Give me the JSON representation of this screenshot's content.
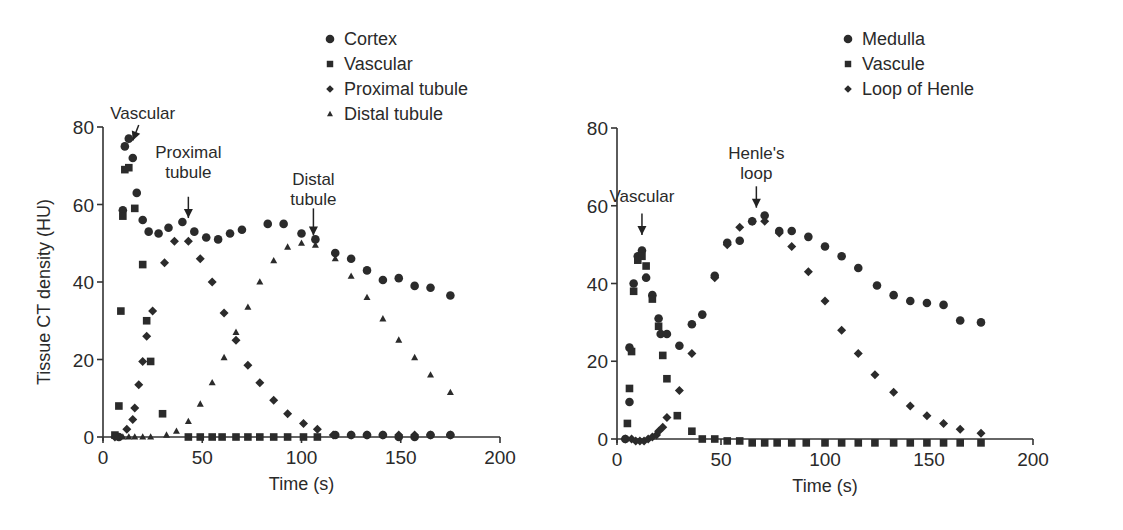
{
  "chart_data": [
    {
      "type": "scatter",
      "title": "",
      "xlabel": "Time (s)",
      "ylabel": "Tissue CT density (HU)",
      "xlim": [
        0,
        200
      ],
      "ylim": [
        0,
        80
      ],
      "xticks": [
        0,
        50,
        100,
        150,
        200
      ],
      "yticks": [
        0,
        20,
        40,
        60,
        80
      ],
      "grid": false,
      "legend_position": "top-right",
      "legend": [
        {
          "label": "Cortex",
          "marker": "circle"
        },
        {
          "label": "Vascular",
          "marker": "square"
        },
        {
          "label": "Proximal tubule",
          "marker": "diamond"
        },
        {
          "label": "Distal tubule",
          "marker": "triangle"
        }
      ],
      "annotations": [
        {
          "text": [
            "Vascular"
          ],
          "text_x": 20,
          "text_y": 82,
          "arrow_from": [
            18,
            80.5
          ],
          "arrow_to": [
            15,
            76.5
          ]
        },
        {
          "text": [
            "Proximal",
            "tubule"
          ],
          "text_x": 43,
          "text_y": 72,
          "arrow_from": [
            43,
            62
          ],
          "arrow_to": [
            43,
            56.5
          ]
        },
        {
          "text": [
            "Distal",
            "tubule"
          ],
          "text_x": 106,
          "text_y": 65,
          "arrow_from": [
            106,
            59
          ],
          "arrow_to": [
            106,
            52
          ]
        }
      ],
      "series": [
        {
          "name": "Cortex",
          "marker": "circle",
          "points": [
            [
              8,
              0
            ],
            [
              10,
              58.5
            ],
            [
              11,
              75
            ],
            [
              13,
              77
            ],
            [
              15,
              72
            ],
            [
              17,
              63
            ],
            [
              20,
              56
            ],
            [
              23,
              53
            ],
            [
              28,
              52.5
            ],
            [
              33,
              54
            ],
            [
              40,
              55.5
            ],
            [
              46,
              53
            ],
            [
              52,
              51.5
            ],
            [
              58,
              51
            ],
            [
              64,
              52.5
            ],
            [
              70,
              53.5
            ],
            [
              83,
              55
            ],
            [
              91,
              55
            ],
            [
              100,
              52.5
            ],
            [
              107,
              51
            ],
            [
              117,
              47.5
            ],
            [
              125,
              46
            ],
            [
              133,
              43
            ],
            [
              141,
              40.5
            ],
            [
              149,
              41
            ],
            [
              157,
              39
            ],
            [
              165,
              38.5
            ],
            [
              175,
              36.5
            ],
            [
              117,
              0.5
            ],
            [
              125,
              0.5
            ],
            [
              133,
              0.5
            ],
            [
              141,
              0.5
            ],
            [
              149,
              0
            ],
            [
              157,
              0
            ],
            [
              165,
              0.5
            ],
            [
              175,
              0.5
            ]
          ]
        },
        {
          "name": "Vascular",
          "marker": "square",
          "points": [
            [
              6,
              0.5
            ],
            [
              8,
              8
            ],
            [
              9,
              32.5
            ],
            [
              10,
              57
            ],
            [
              11,
              69
            ],
            [
              13,
              69.5
            ],
            [
              16,
              59
            ],
            [
              20,
              44.5
            ],
            [
              22,
              30
            ],
            [
              24,
              19.5
            ],
            [
              30,
              6
            ],
            [
              43,
              0
            ],
            [
              49,
              0
            ],
            [
              55,
              0
            ],
            [
              60,
              0
            ],
            [
              67,
              0
            ],
            [
              73,
              0
            ],
            [
              79,
              0
            ],
            [
              86,
              0
            ],
            [
              93,
              0
            ],
            [
              101,
              0
            ],
            [
              108,
              0
            ]
          ]
        },
        {
          "name": "Proximal tubule",
          "marker": "diamond",
          "points": [
            [
              6,
              0
            ],
            [
              12,
              2
            ],
            [
              15,
              4.5
            ],
            [
              16,
              7.5
            ],
            [
              18,
              13.5
            ],
            [
              20,
              19.5
            ],
            [
              22,
              26
            ],
            [
              25,
              32.5
            ],
            [
              31,
              45
            ],
            [
              36,
              50.5
            ],
            [
              43,
              50.5
            ],
            [
              49,
              46
            ],
            [
              55,
              40
            ],
            [
              61,
              32
            ],
            [
              67,
              25
            ],
            [
              73,
              18.5
            ],
            [
              79,
              14
            ],
            [
              86,
              9.5
            ],
            [
              93,
              6
            ],
            [
              101,
              3.5
            ],
            [
              108,
              2
            ],
            [
              116,
              0.5
            ],
            [
              125,
              0.5
            ],
            [
              133,
              0.5
            ],
            [
              141,
              0.5
            ],
            [
              149,
              0.5
            ],
            [
              157,
              0.5
            ],
            [
              165,
              0.5
            ],
            [
              175,
              0.5
            ]
          ]
        },
        {
          "name": "Distal tubule",
          "marker": "triangle",
          "points": [
            [
              7,
              0
            ],
            [
              10,
              0
            ],
            [
              13,
              0
            ],
            [
              16,
              0
            ],
            [
              20,
              0
            ],
            [
              24,
              0
            ],
            [
              32,
              0.5
            ],
            [
              37,
              1.5
            ],
            [
              43,
              4
            ],
            [
              49,
              8.5
            ],
            [
              55,
              14
            ],
            [
              61,
              20.5
            ],
            [
              67,
              27
            ],
            [
              73,
              33.5
            ],
            [
              79,
              40
            ],
            [
              86,
              45.5
            ],
            [
              93,
              49
            ],
            [
              100,
              50
            ],
            [
              107,
              49.5
            ],
            [
              117,
              46
            ],
            [
              125,
              41.5
            ],
            [
              133,
              36
            ],
            [
              141,
              30.5
            ],
            [
              149,
              25
            ],
            [
              157,
              20.5
            ],
            [
              165,
              16
            ],
            [
              175,
              11.5
            ]
          ]
        }
      ]
    },
    {
      "type": "scatter",
      "title": "",
      "xlabel": "Time (s)",
      "ylabel": "",
      "xlim": [
        0,
        200
      ],
      "ylim": [
        0,
        80
      ],
      "xticks": [
        0,
        50,
        100,
        150,
        200
      ],
      "yticks": [
        0,
        20,
        40,
        60,
        80
      ],
      "grid": false,
      "legend_position": "top-right",
      "legend": [
        {
          "label": "Medulla",
          "marker": "circle"
        },
        {
          "label": "Vascule",
          "marker": "square"
        },
        {
          "label": "Loop of Henle",
          "marker": "diamond"
        }
      ],
      "annotations": [
        {
          "text": [
            "Vascular"
          ],
          "text_x": 12,
          "text_y": 61,
          "arrow_from": [
            12,
            58
          ],
          "arrow_to": [
            12,
            52.5
          ]
        },
        {
          "text": [
            "Henle's",
            "loop"
          ],
          "text_x": 67,
          "text_y": 72,
          "arrow_from": [
            67,
            65
          ],
          "arrow_to": [
            67,
            59.5
          ]
        }
      ],
      "series": [
        {
          "name": "Medulla",
          "marker": "circle",
          "points": [
            [
              4,
              0
            ],
            [
              6,
              9.5
            ],
            [
              6,
              23.5
            ],
            [
              8,
              40
            ],
            [
              10,
              47
            ],
            [
              12,
              48.5
            ],
            [
              14,
              41.5
            ],
            [
              17,
              37
            ],
            [
              20,
              31
            ],
            [
              21,
              27
            ],
            [
              24,
              27
            ],
            [
              30,
              24
            ],
            [
              36,
              29.5
            ],
            [
              41,
              32
            ],
            [
              47,
              42
            ],
            [
              53,
              50.5
            ],
            [
              59,
              51
            ],
            [
              65,
              56
            ],
            [
              71,
              57.5
            ],
            [
              78,
              53.5
            ],
            [
              84,
              53.5
            ],
            [
              92,
              52
            ],
            [
              100,
              49.5
            ],
            [
              108,
              47
            ],
            [
              116,
              44
            ],
            [
              125,
              39.5
            ],
            [
              133,
              37
            ],
            [
              141,
              35.5
            ],
            [
              149,
              35
            ],
            [
              157,
              34.5
            ],
            [
              165,
              30.5
            ],
            [
              175,
              30
            ]
          ]
        },
        {
          "name": "Vascule",
          "marker": "square",
          "points": [
            [
              5,
              4
            ],
            [
              6,
              13
            ],
            [
              7,
              22.5
            ],
            [
              8,
              38
            ],
            [
              10,
              46
            ],
            [
              12,
              47
            ],
            [
              14,
              44.5
            ],
            [
              17,
              36
            ],
            [
              20,
              29
            ],
            [
              22,
              21.5
            ],
            [
              24,
              15.5
            ],
            [
              29,
              6
            ],
            [
              36,
              2
            ],
            [
              41,
              0
            ],
            [
              47,
              0
            ],
            [
              53,
              -0.5
            ],
            [
              59,
              -0.5
            ],
            [
              65,
              -1
            ],
            [
              71,
              -1
            ],
            [
              77,
              -1
            ],
            [
              84,
              -1
            ],
            [
              91,
              -1
            ],
            [
              100,
              -1
            ],
            [
              108,
              -1
            ],
            [
              116,
              -1
            ],
            [
              124,
              -1
            ],
            [
              133,
              -1
            ],
            [
              141,
              -1
            ],
            [
              149,
              -1
            ],
            [
              157,
              -1
            ],
            [
              165,
              -1
            ],
            [
              175,
              -1
            ]
          ]
        },
        {
          "name": "Loop of Henle",
          "marker": "diamond",
          "points": [
            [
              4,
              0
            ],
            [
              7,
              0
            ],
            [
              9,
              -0.5
            ],
            [
              11,
              -0.5
            ],
            [
              13,
              -0.5
            ],
            [
              15,
              0
            ],
            [
              17,
              0.5
            ],
            [
              19,
              1
            ],
            [
              20,
              2
            ],
            [
              22,
              3
            ],
            [
              24,
              5.5
            ],
            [
              30,
              12.5
            ],
            [
              36,
              22
            ],
            [
              47,
              41.5
            ],
            [
              53,
              50
            ],
            [
              59,
              54.5
            ],
            [
              65,
              56
            ],
            [
              71,
              56
            ],
            [
              78,
              53
            ],
            [
              84,
              49.5
            ],
            [
              92,
              43
            ],
            [
              100,
              35.5
            ],
            [
              108,
              28
            ],
            [
              116,
              22
            ],
            [
              124,
              16.5
            ],
            [
              133,
              12
            ],
            [
              141,
              8.5
            ],
            [
              149,
              6
            ],
            [
              157,
              4
            ],
            [
              165,
              2.5
            ],
            [
              175,
              1.5
            ]
          ]
        }
      ]
    }
  ],
  "panels": {
    "left": {
      "ylabel": "Tissue CT density (HU)",
      "xlabel": "Time (s)",
      "legend": [
        "Cortex",
        "Vascular",
        "Proximal tubule",
        "Distal tubule"
      ]
    },
    "right": {
      "xlabel": "Time (s)",
      "legend": [
        "Medulla",
        "Vascule",
        "Loop of Henle"
      ]
    }
  }
}
